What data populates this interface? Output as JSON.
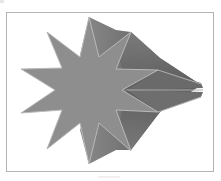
{
  "image": {
    "subject": "3D extruded eleven-point star",
    "colors": {
      "face": "#8c8c8c",
      "extrusion_dark": "#5a5a5a",
      "extrusion_light": "#a0a0a0",
      "edge_highlight": "#b9b9b9",
      "frame_border": "#b4b4b4",
      "background": "#ffffff"
    }
  }
}
